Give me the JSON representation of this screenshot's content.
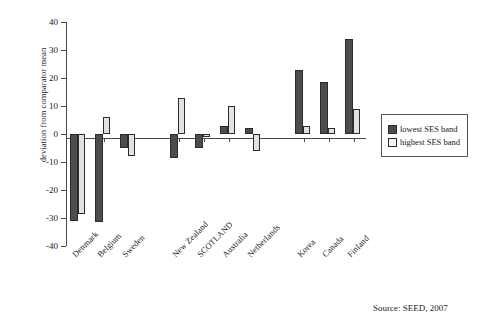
{
  "chart_data": {
    "type": "bar",
    "title": "",
    "xlabel": "",
    "ylabel": "deviation from comparator mean",
    "ylim": [
      -40,
      40
    ],
    "ytick_labels": [
      "40",
      "30",
      "20",
      "10",
      "0",
      "-10",
      "-20",
      "-30",
      "-40"
    ],
    "ytick_values": [
      40,
      30,
      20,
      10,
      0,
      -10,
      -20,
      -30,
      -40
    ],
    "grid": false,
    "legend_position": "right",
    "categories": [
      "Denmark",
      "Belgium",
      "Sweden",
      "New Zealand",
      "SCOTLAND",
      "Australia",
      "Netherlands",
      "Korea",
      "Canada",
      "Finland"
    ],
    "group_breaks_after": [
      "Sweden",
      "Netherlands"
    ],
    "series": [
      {
        "name": "lowest SES band",
        "color": "#4d4d4d",
        "values": [
          -31,
          -31.5,
          -5,
          -8.5,
          -5,
          3,
          2,
          23,
          18.5,
          34
        ]
      },
      {
        "name": "highest SES band",
        "color": "#e2e2e2",
        "values": [
          -28.5,
          6,
          -8,
          13,
          -1,
          10,
          -6,
          3,
          2,
          9
        ]
      }
    ]
  },
  "legend": {
    "items": [
      {
        "label": "lowest SES band"
      },
      {
        "label": "highest SES band"
      }
    ]
  },
  "source": {
    "text": "Source: SEED, 2007"
  }
}
